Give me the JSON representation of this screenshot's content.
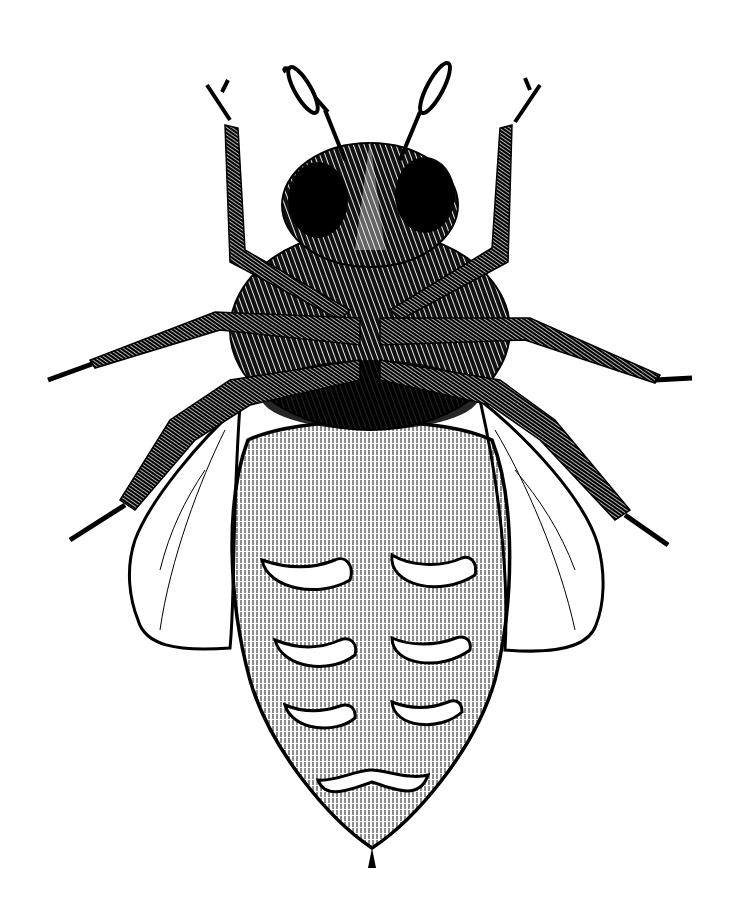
{
  "image": {
    "subject": "bee, ventral view",
    "style": "black ink pen-and-hatching illustration",
    "background_color": "#ffffff",
    "ink_color": "#000000"
  },
  "parts": {
    "antennae": 2,
    "legs": 6,
    "wings_visible": 2,
    "abdomen_segment_plates": 6
  }
}
